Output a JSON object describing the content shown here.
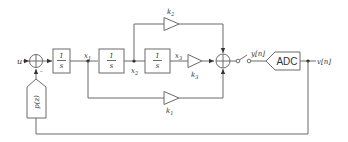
{
  "diagram": {
    "type": "block-diagram",
    "title": "",
    "colors": {
      "line": "#6b6b6b",
      "text": "#333333",
      "background": "#ffffff"
    },
    "input": {
      "label": "u"
    },
    "summer_input": {
      "signs": [
        "+",
        "-"
      ],
      "minus_label": "−"
    },
    "integrators": [
      {
        "num": "1",
        "den": "s",
        "output": "x1"
      },
      {
        "num": "1",
        "den": "s",
        "output": "x2"
      },
      {
        "num": "1",
        "den": "s",
        "output": "x3"
      }
    ],
    "node_labels": {
      "x1": "x",
      "x1_sub": "1",
      "x2": "x",
      "x2_sub": "2",
      "x3": "x",
      "x3_sub": "3"
    },
    "gains": [
      {
        "name": "k1",
        "label": "k",
        "sub": "1"
      },
      {
        "name": "k2",
        "label": "k",
        "sub": "2"
      },
      {
        "name": "k3",
        "label": "k",
        "sub": "3"
      }
    ],
    "switch_output": {
      "label": "y[n]"
    },
    "adc": {
      "label": "ADC"
    },
    "output": {
      "label": "v[n]"
    },
    "feedback_filter": {
      "label": "p(z)"
    }
  }
}
